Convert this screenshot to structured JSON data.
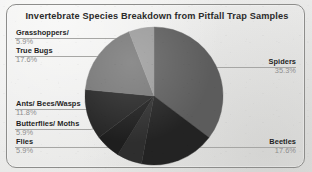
{
  "figure": {
    "title": "Invertebrate Species Breakdown from Pitfall Trap Samples",
    "frame_color": "#8d8d8b",
    "background_color": "#ececeb"
  },
  "labels": {
    "grasshoppers": {
      "name": "Grasshoppers/",
      "pct": "5.9%"
    },
    "true_bugs": {
      "name": "True Bugs",
      "pct": "17.6%"
    },
    "ants": {
      "name": "Ants/ Bees/Wasps",
      "pct": "11.8%"
    },
    "butterflies": {
      "name": "Butterflies/ Moths",
      "pct": "5.9%"
    },
    "flies": {
      "name": "Flies",
      "pct": "5.9%"
    },
    "spiders": {
      "name": "Spiders",
      "pct": "35.3%"
    },
    "beetles": {
      "name": "Beetles",
      "pct": "17.6%"
    }
  },
  "chart_data": {
    "type": "pie",
    "title": "Invertebrate Species Breakdown from Pitfall Trap Samples",
    "xlabel": "",
    "ylabel": "",
    "legend": "none",
    "grid": false,
    "units": "percent",
    "total": 100,
    "labels_show_percent": true,
    "start_angle_deg": 0,
    "direction": "clockwise",
    "categories": [
      "Spiders",
      "Beetles",
      "Flies",
      "Butterflies/ Moths",
      "Ants/ Bees/Wasps",
      "True Bugs",
      "Grasshoppers/"
    ],
    "values": [
      35.3,
      17.6,
      5.9,
      5.9,
      11.8,
      17.6,
      5.9
    ],
    "colors": [
      "#5c5c5c",
      "#232323",
      "#2e2e2e",
      "#1e1e1e",
      "#262626",
      "#767676",
      "#9a9a9a"
    ],
    "slices": [
      {
        "label": "Spiders",
        "value": 35.3,
        "color": "#5c5c5c"
      },
      {
        "label": "Beetles",
        "value": 17.6,
        "color": "#232323"
      },
      {
        "label": "Flies",
        "value": 5.9,
        "color": "#2e2e2e"
      },
      {
        "label": "Butterflies/ Moths",
        "value": 5.9,
        "color": "#1e1e1e"
      },
      {
        "label": "Ants/ Bees/Wasps",
        "value": 11.8,
        "color": "#262626"
      },
      {
        "label": "True Bugs",
        "value": 17.6,
        "color": "#767676"
      },
      {
        "label": "Grasshoppers/",
        "value": 5.9,
        "color": "#9a9a9a"
      }
    ]
  }
}
